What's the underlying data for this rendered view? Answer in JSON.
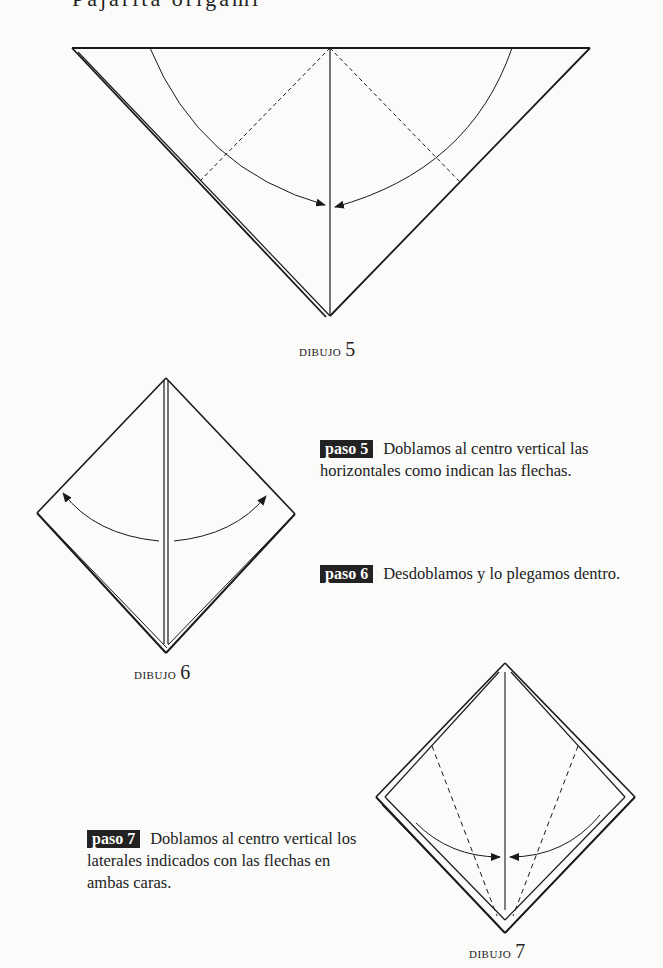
{
  "page": {
    "header_partial": "Pajarita origami"
  },
  "figures": [
    {
      "id": "dibujo-5",
      "caption_word": "dibujo",
      "caption_num": "5"
    },
    {
      "id": "dibujo-6",
      "caption_word": "dibujo",
      "caption_num": "6"
    },
    {
      "id": "dibujo-7",
      "caption_word": "dibujo",
      "caption_num": "7"
    }
  ],
  "steps": [
    {
      "badge": "paso 5",
      "text": "Doblamos al centro vertical las horizontales como indican las flechas."
    },
    {
      "badge": "paso 6",
      "text": "Desdoblamos y lo plegamos dentro."
    },
    {
      "badge": "paso 7",
      "text": "Doblamos al centro vertical los laterales indicados con las flechas en ambas caras."
    }
  ],
  "colors": {
    "background": "#fbfbfa",
    "ink": "#1a1a1a",
    "badge_bg": "#222222",
    "badge_text": "#ffffff"
  }
}
